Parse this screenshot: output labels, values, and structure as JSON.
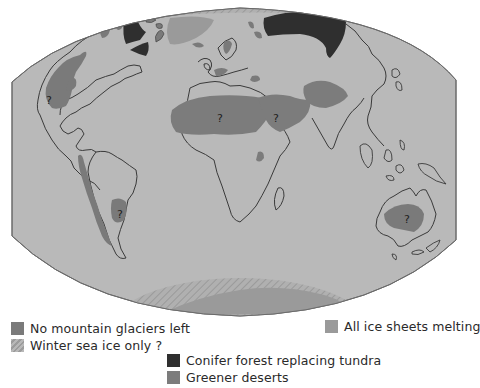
{
  "map": {
    "projection": "world map (Robinson-like, rounded edges)",
    "colors": {
      "ocean": "#b9b9b9",
      "coast": "#3a3a3a",
      "no_glaciers": "#7a7a7a",
      "conifer": "#2f2f2f",
      "ice_sheets": "#9a9a9a",
      "greener_deserts": "#7c7c7c",
      "sea_ice_hatch": "#a8a8a8"
    },
    "uncertainty_marks": [
      {
        "label": "?",
        "region": "western North America"
      },
      {
        "label": "?",
        "region": "Sahara"
      },
      {
        "label": "?",
        "region": "Arabia"
      },
      {
        "label": "?",
        "region": "southern South America"
      },
      {
        "label": "?",
        "region": "Australia"
      }
    ]
  },
  "legend": {
    "items": [
      {
        "id": "no-glaciers",
        "label": "No mountain glaciers left",
        "color": "#7a7a7a"
      },
      {
        "id": "sea-ice",
        "label": "Winter sea ice only ?",
        "color": "#a8a8a8",
        "pattern": "hatched"
      },
      {
        "id": "ice-sheets",
        "label": "All ice sheets melting",
        "color": "#9a9a9a"
      },
      {
        "id": "conifer",
        "label": "Conifer forest replacing tundra",
        "color": "#2f2f2f"
      },
      {
        "id": "deserts",
        "label": "Greener deserts",
        "color": "#7c7c7c"
      }
    ]
  }
}
